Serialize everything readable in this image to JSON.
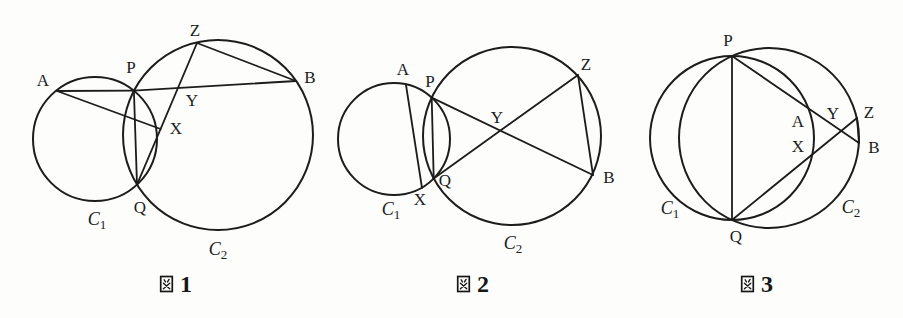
{
  "page": {
    "background": "#fdfdfb",
    "ink": "#1c1c1c",
    "width": 903,
    "height": 318
  },
  "figures": [
    {
      "id": "figure-1",
      "caption": "図 1",
      "caption_number": "1",
      "caption_center": {
        "x": 175,
        "y": 284
      },
      "circles": [
        {
          "label": "C1",
          "cx": 95,
          "cy": 139,
          "r": 62
        },
        {
          "label": "C2",
          "cx": 218,
          "cy": 135,
          "r": 95
        }
      ],
      "segments": [
        {
          "name": "A-P",
          "x1": 57,
          "y1": 91,
          "x2": 133.9,
          "y2": 90.7
        },
        {
          "name": "P-B",
          "x1": 133.9,
          "y1": 90.7,
          "x2": 296,
          "y2": 81
        },
        {
          "name": "Z-Q",
          "x1": 197,
          "y1": 43,
          "x2": 137,
          "y2": 184.6
        },
        {
          "name": "A-X",
          "x1": 57,
          "y1": 91,
          "x2": 160.6,
          "y2": 129
        },
        {
          "name": "Z-B",
          "x1": 197,
          "y1": 43,
          "x2": 296,
          "y2": 81
        },
        {
          "name": "P-Q",
          "x1": 133.9,
          "y1": 90.7,
          "x2": 137,
          "y2": 184.6
        }
      ],
      "point_labels": [
        {
          "text": "A",
          "x": 43,
          "y": 80
        },
        {
          "text": "P",
          "x": 131,
          "y": 67
        },
        {
          "text": "Z",
          "x": 195,
          "y": 30
        },
        {
          "text": "B",
          "x": 310,
          "y": 77
        },
        {
          "text": "Y",
          "x": 192,
          "y": 100
        },
        {
          "text": "X",
          "x": 176,
          "y": 128
        },
        {
          "text": "Q",
          "x": 140,
          "y": 207
        }
      ],
      "circle_labels": [
        {
          "base": "C",
          "sub": "1",
          "x": 97,
          "y": 219
        },
        {
          "base": "C",
          "sub": "2",
          "x": 218,
          "y": 249
        }
      ]
    },
    {
      "id": "figure-2",
      "caption": "図 2",
      "caption_number": "2",
      "caption_center": {
        "x": 472,
        "y": 284
      },
      "circles": [
        {
          "label": "C1",
          "cx": 394,
          "cy": 139,
          "r": 56
        },
        {
          "label": "C2",
          "cx": 512,
          "cy": 136,
          "r": 89
        }
      ],
      "segments": [
        {
          "name": "A-X",
          "x1": 406,
          "y1": 85,
          "x2": 422,
          "y2": 188
        },
        {
          "name": "P-Q",
          "x1": 431.7,
          "y1": 97.6,
          "x2": 433.7,
          "y2": 178.4
        },
        {
          "name": "P-B",
          "x1": 431.7,
          "y1": 97.6,
          "x2": 593,
          "y2": 175
        },
        {
          "name": "Z-Q",
          "x1": 578,
          "y1": 75,
          "x2": 433.7,
          "y2": 178.4
        },
        {
          "name": "Z-B",
          "x1": 578,
          "y1": 75,
          "x2": 593,
          "y2": 175
        }
      ],
      "point_labels": [
        {
          "text": "A",
          "x": 403,
          "y": 69
        },
        {
          "text": "P",
          "x": 430,
          "y": 81
        },
        {
          "text": "Z",
          "x": 586,
          "y": 64
        },
        {
          "text": "B",
          "x": 609,
          "y": 177
        },
        {
          "text": "Y",
          "x": 497,
          "y": 117
        },
        {
          "text": "X",
          "x": 420,
          "y": 199
        },
        {
          "text": "Q",
          "x": 445,
          "y": 180
        }
      ],
      "circle_labels": [
        {
          "base": "C",
          "sub": "1",
          "x": 391,
          "y": 209
        },
        {
          "base": "C",
          "sub": "2",
          "x": 513,
          "y": 243
        }
      ]
    },
    {
      "id": "figure-3",
      "caption": "図 3",
      "caption_number": "3",
      "caption_center": {
        "x": 756,
        "y": 284
      },
      "circles": [
        {
          "label": "C1",
          "cx": 732,
          "cy": 138,
          "r": 82
        },
        {
          "label": "C2",
          "cx": 769,
          "cy": 138,
          "r": 90
        }
      ],
      "segments": [
        {
          "name": "P-Q",
          "x1": 732,
          "y1": 56,
          "x2": 732,
          "y2": 220
        },
        {
          "name": "P-B",
          "x1": 732,
          "y1": 56,
          "x2": 859,
          "y2": 143
        },
        {
          "name": "Q-Z",
          "x1": 732,
          "y1": 220,
          "x2": 857,
          "y2": 118
        },
        {
          "name": "Z-B",
          "x1": 857,
          "y1": 118,
          "x2": 859,
          "y2": 143
        }
      ],
      "point_labels": [
        {
          "text": "P",
          "x": 728,
          "y": 40
        },
        {
          "text": "Q",
          "x": 736,
          "y": 236
        },
        {
          "text": "Z",
          "x": 869,
          "y": 112
        },
        {
          "text": "B",
          "x": 874,
          "y": 147
        },
        {
          "text": "Y",
          "x": 833,
          "y": 113
        },
        {
          "text": "A",
          "x": 798,
          "y": 121
        },
        {
          "text": "X",
          "x": 798,
          "y": 146
        }
      ],
      "circle_labels": [
        {
          "base": "C",
          "sub": "1",
          "x": 670,
          "y": 208
        },
        {
          "base": "C",
          "sub": "2",
          "x": 851,
          "y": 207
        }
      ]
    }
  ]
}
